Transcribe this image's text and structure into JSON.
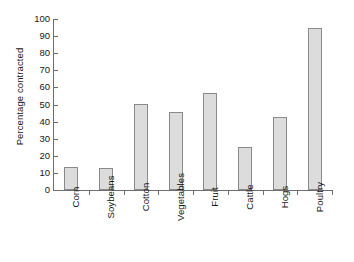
{
  "chart_data": {
    "type": "bar",
    "title": "",
    "xlabel": "",
    "ylabel": "Percentage contracted",
    "categories": [
      "Corn",
      "Soybeans",
      "Cotton",
      "Vegetables",
      "Fruit",
      "Cattle",
      "Hogs",
      "Poultry"
    ],
    "values": [
      13.5,
      13,
      50.5,
      45.5,
      56.5,
      25,
      42.5,
      94.5
    ],
    "ylim": [
      0,
      100
    ],
    "ytick_values": [
      0,
      10,
      20,
      30,
      40,
      50,
      60,
      70,
      80,
      90,
      100
    ],
    "ytick_labels": [
      "0",
      "10",
      "20",
      "30",
      "40",
      "50",
      "60",
      "70",
      "80",
      "90",
      "100"
    ],
    "grid": false,
    "legend": null,
    "bar_fill_color": "#dcdcdc",
    "bar_border_color": "#8a8a8a",
    "axis_color": "#6e6e6e"
  }
}
